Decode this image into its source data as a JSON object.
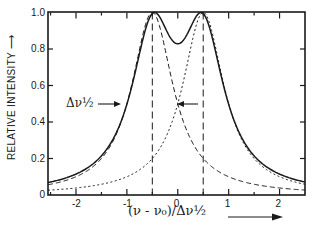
{
  "chart_data": {
    "type": "line",
    "title": "",
    "xlabel": "(ν - ν₀)/Δν½",
    "ylabel": "RELATIVE INTENSITY",
    "xlim": [
      -2.55,
      2.5
    ],
    "ylim": [
      0,
      1.0
    ],
    "x_ticks": [
      -2,
      -1,
      0,
      1,
      2
    ],
    "x_tick_labels": [
      "-2",
      "-1",
      "0",
      "1",
      "2"
    ],
    "y_ticks": [
      0,
      0.2,
      0.4,
      0.6,
      0.8,
      1.0
    ],
    "y_tick_labels": [
      "0",
      "0.2",
      "0.4",
      "0.6",
      "0.8",
      "1.0"
    ],
    "grid": false,
    "legend": null,
    "series": [
      {
        "name": "sum of two lines",
        "style": "solid",
        "model": "sum",
        "peak_height": 1.0
      },
      {
        "name": "component line at -0.5",
        "style": "dashed",
        "model": "lorentzian",
        "center": -0.5,
        "hwhm": 0.5,
        "peak_height": 1.0
      },
      {
        "name": "component line at +0.5",
        "style": "dotted",
        "model": "lorentzian",
        "center": 0.5,
        "hwhm": 0.5,
        "peak_height": 1.0
      }
    ],
    "vertical_markers": [
      {
        "x": -0.5,
        "style": "dashed"
      },
      {
        "x": 0.5,
        "style": "dashed"
      }
    ],
    "annotations": [
      {
        "text": "Δν½",
        "x": -1.45,
        "y": 0.48,
        "arrow_to_x": -1.0,
        "arrow_to_y": 0.5
      },
      {
        "text": "",
        "x": 0.4,
        "y": 0.5,
        "arrow_to_x": -0.05,
        "arrow_to_y": 0.5,
        "note": "arrow marking half width"
      }
    ],
    "x_direction_arrow": true,
    "y_direction_arrow": true
  },
  "labels": {
    "ylabel": "RELATIVE INTENSITY",
    "ylabel_arrow": "⟶",
    "xlabel": "(ν - ν₀)/Δν½",
    "annotation": "Δν½",
    "x_tick_labels": [
      "-2",
      "-1",
      "0",
      "1",
      "2"
    ],
    "y_tick_labels": [
      "0",
      "0.2",
      "0.4",
      "0.6",
      "0.8",
      "1.0"
    ]
  }
}
